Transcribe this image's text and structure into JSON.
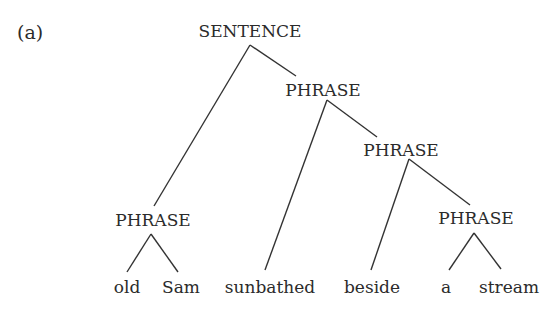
{
  "panel_label": "(a)",
  "tree": {
    "root": "SENTENCE",
    "nodes": {
      "sentence": "SENTENCE",
      "phrase_vp": "PHRASE",
      "phrase_pp": "PHRASE",
      "phrase_subject": "PHRASE",
      "phrase_object": "PHRASE"
    },
    "words": [
      "old",
      "Sam",
      "sunbathed",
      "beside",
      "a",
      "stream"
    ],
    "structure": "SENTENCE → [PHRASE(old Sam), PHRASE(sunbathed, PHRASE(beside, PHRASE(a stream)))]"
  },
  "colors": {
    "text": "#2b2b2b",
    "lines": "#333333",
    "background": "#ffffff"
  }
}
